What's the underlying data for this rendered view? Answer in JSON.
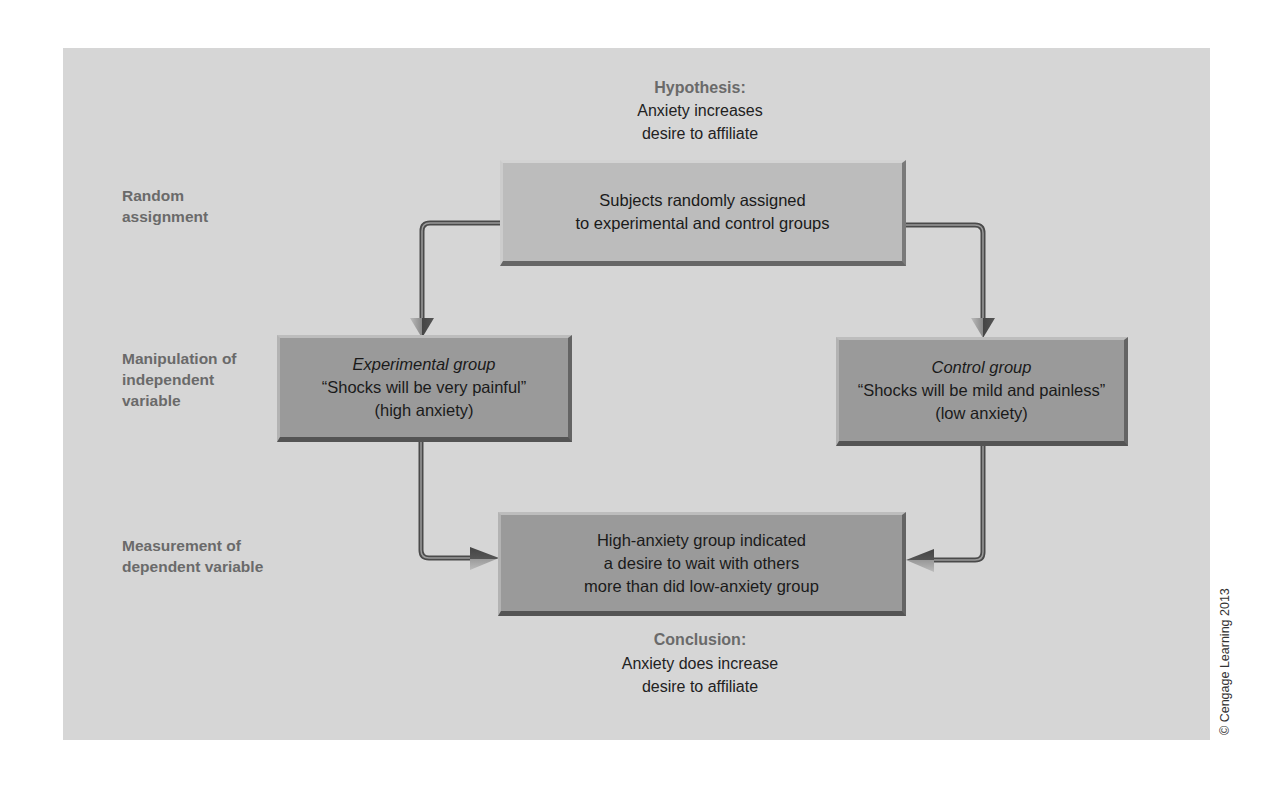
{
  "hypothesis": {
    "title": "Hypothesis:",
    "lines": [
      "Anxiety increases",
      "desire to affiliate"
    ]
  },
  "row_labels": {
    "random_assignment": [
      "Random",
      "assignment"
    ],
    "manipulation": [
      "Manipulation of",
      "independent",
      "variable"
    ],
    "measurement": [
      "Measurement of",
      "dependent variable"
    ]
  },
  "boxes": {
    "assignment": {
      "lines": [
        "Subjects randomly assigned",
        "to experimental and control groups"
      ]
    },
    "experimental": {
      "title": "Experimental group",
      "lines": [
        "“Shocks will be very painful”",
        "(high anxiety)"
      ]
    },
    "control": {
      "title": "Control group",
      "lines": [
        "“Shocks will be mild and painless”",
        "(low anxiety)"
      ]
    },
    "measurement": {
      "lines": [
        "High-anxiety group indicated",
        "a desire to wait with others",
        "more than did low-anxiety group"
      ]
    }
  },
  "conclusion": {
    "title": "Conclusion:",
    "lines": [
      "Anxiety does increase",
      "desire to affiliate"
    ]
  },
  "copyright": "© Cengage Learning 2013",
  "colors": {
    "panel_bg": "#d6d6d6",
    "box_light": "#bcbcbc",
    "box_dark": "#9a9a9a",
    "label_gray": "#6a6a6a",
    "connector": "#555555"
  }
}
